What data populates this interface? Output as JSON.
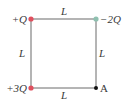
{
  "diagram": {
    "side_label": "L",
    "sides": {
      "top": "L",
      "left": "L",
      "right": "L",
      "bottom": "L"
    },
    "corners": {
      "top_left": {
        "label": "+Q",
        "color": "#e0505e"
      },
      "top_right": {
        "label": "−2Q",
        "color": "#8fc0b0"
      },
      "bottom_left": {
        "label": "+3Q",
        "color": "#e0505e"
      },
      "bottom_right": {
        "label": "A",
        "color": "#111111"
      }
    },
    "line_color": "#666666"
  }
}
